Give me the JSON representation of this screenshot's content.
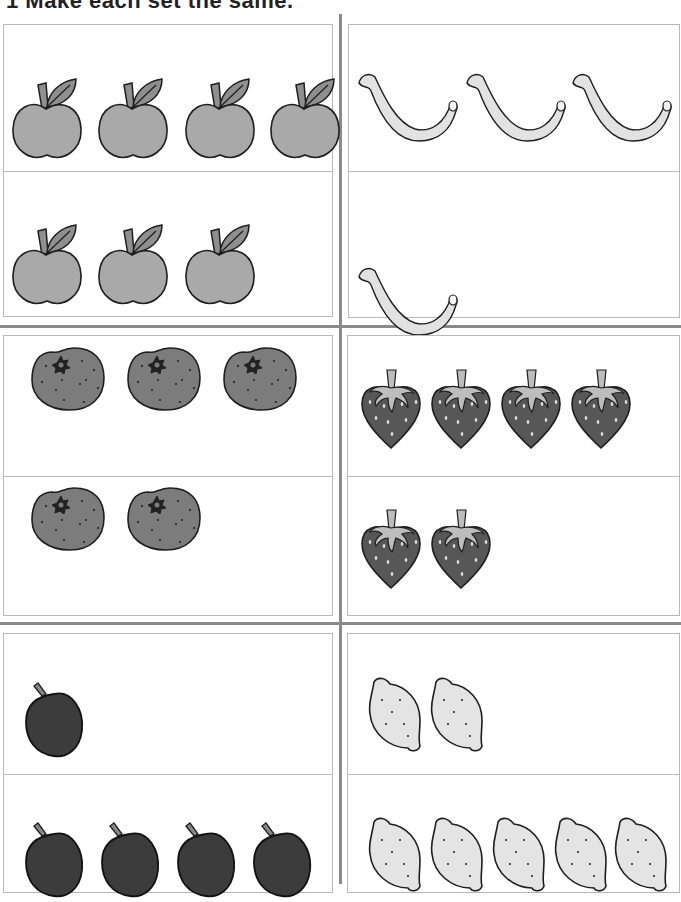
{
  "title": "1  Make each set the same.",
  "colors": {
    "outline": "#1e1e1e",
    "apple": "#a9a9a9",
    "leaf": "#8f8f8f",
    "banana": "#e2e2e2",
    "orange": "#7c7c7c",
    "strawberry": "#575757",
    "strawberry_top": "#bdbdbd",
    "plum": "#3c3c3c",
    "lemon": "#e4e4e4",
    "divider": "#8a8a8a",
    "box_border": "#b8b8b8"
  },
  "sets": [
    {
      "fruit": "apple",
      "top_count": 4,
      "bottom_count": 3
    },
    {
      "fruit": "banana",
      "top_count": 3,
      "bottom_count": 1
    },
    {
      "fruit": "orange",
      "top_count": 3,
      "bottom_count": 2
    },
    {
      "fruit": "strawberry",
      "top_count": 4,
      "bottom_count": 2
    },
    {
      "fruit": "plum",
      "top_count": 1,
      "bottom_count": 4
    },
    {
      "fruit": "lemon",
      "top_count": 2,
      "bottom_count": 5
    }
  ]
}
